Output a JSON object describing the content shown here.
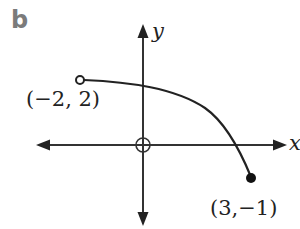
{
  "panel": {
    "label": "b"
  },
  "axes": {
    "x_label": "x",
    "y_label": "y",
    "origin_marker": "circle-cross"
  },
  "points": [
    {
      "label": "(−2, 2)",
      "x": -2,
      "y": 2,
      "style": "open"
    },
    {
      "label": "(3,−1)",
      "x": 3,
      "y": -1,
      "style": "closed"
    }
  ],
  "curve": {
    "description": "decreasing concave-down curve from open point (-2,2) to closed point (3,-1)",
    "start": [
      -2,
      2
    ],
    "end": [
      3,
      -1
    ],
    "start_endpoint": "open",
    "end_endpoint": "closed"
  },
  "colors": {
    "ink": "#222222",
    "panel_label": "#7b7b7b",
    "background": "#ffffff"
  }
}
